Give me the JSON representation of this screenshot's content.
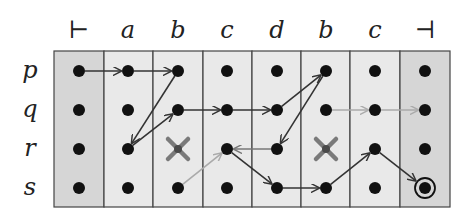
{
  "diagram": {
    "type": "automaton-run-grid",
    "column_labels": [
      "⊢",
      "a",
      "b",
      "c",
      "d",
      "b",
      "c",
      "⊣"
    ],
    "row_labels": [
      "p",
      "q",
      "r",
      "s"
    ],
    "columns_x": [
      79,
      128,
      178,
      227,
      277,
      326,
      375,
      425
    ],
    "rows_y": [
      71,
      110,
      149,
      188
    ],
    "grid": {
      "left": 54,
      "top": 51,
      "right": 450,
      "bottom": 207,
      "col_edges": [
        54,
        104,
        153,
        203,
        252,
        301,
        350,
        400,
        450
      ]
    },
    "colors": {
      "end_column_fill": "#d6d6d6",
      "mid_column_fill": "#e9e9e9",
      "grid_line": "#444444",
      "dot": "#111111",
      "arrow_dark": "#333333",
      "arrow_medium": "#777777",
      "arrow_light": "#aaaaaa",
      "cross": "#7a7a7a",
      "cross_center": "#4a4a4a"
    },
    "crossed_states": [
      {
        "row": 2,
        "col": 2,
        "label": "r@b"
      },
      {
        "row": 2,
        "col": 5,
        "label": "r@b"
      }
    ],
    "accepting_state": {
      "row": 3,
      "col": 7,
      "label": "s@⊣"
    },
    "transitions": [
      {
        "from": [
          0,
          0
        ],
        "to": [
          0,
          1
        ],
        "style": "dark"
      },
      {
        "from": [
          0,
          1
        ],
        "to": [
          0,
          2
        ],
        "style": "dark"
      },
      {
        "from": [
          0,
          2
        ],
        "to": [
          2,
          1
        ],
        "style": "dark"
      },
      {
        "from": [
          2,
          1
        ],
        "to": [
          1,
          2
        ],
        "style": "dark"
      },
      {
        "from": [
          1,
          2
        ],
        "to": [
          1,
          3
        ],
        "style": "dark"
      },
      {
        "from": [
          1,
          3
        ],
        "to": [
          1,
          4
        ],
        "style": "dark"
      },
      {
        "from": [
          1,
          4
        ],
        "to": [
          0,
          5
        ],
        "style": "dark"
      },
      {
        "from": [
          0,
          5
        ],
        "to": [
          2,
          4
        ],
        "style": "dark"
      },
      {
        "from": [
          2,
          4
        ],
        "to": [
          2,
          3
        ],
        "style": "medium"
      },
      {
        "from": [
          2,
          3
        ],
        "to": [
          3,
          4
        ],
        "style": "dark"
      },
      {
        "from": [
          3,
          4
        ],
        "to": [
          3,
          5
        ],
        "style": "dark"
      },
      {
        "from": [
          3,
          5
        ],
        "to": [
          2,
          6
        ],
        "style": "dark"
      },
      {
        "from": [
          2,
          6
        ],
        "to": [
          3,
          7
        ],
        "style": "dark"
      },
      {
        "from": [
          3,
          2
        ],
        "to": [
          2,
          3
        ],
        "style": "light"
      },
      {
        "from": [
          1,
          5
        ],
        "to": [
          1,
          6
        ],
        "style": "light"
      },
      {
        "from": [
          1,
          6
        ],
        "to": [
          1,
          7
        ],
        "style": "light"
      }
    ]
  }
}
